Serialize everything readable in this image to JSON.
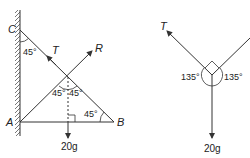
{
  "left_diagram": {
    "points": {
      "C": "C",
      "A": "A",
      "B": "B"
    },
    "forces": {
      "tension": "T",
      "reaction": "R",
      "weight": "20g"
    },
    "angles": {
      "at_C": "45°",
      "top_left": "45°",
      "top_right": "45°",
      "at_B": "45°"
    }
  },
  "right_diagram": {
    "forces": {
      "tension": "T",
      "weight": "20g"
    },
    "angles": {
      "left": "135°",
      "right": "135°"
    }
  },
  "colors": {
    "line": "#333333",
    "background": "#ffffff"
  }
}
